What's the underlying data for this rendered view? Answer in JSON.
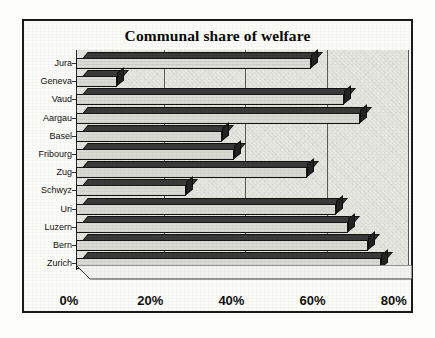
{
  "chart_data": {
    "type": "bar",
    "orientation": "horizontal",
    "title": "Communal share of welfare",
    "xlabel": "",
    "ylabel": "",
    "categories": [
      "Jura",
      "Geneva",
      "Vaud",
      "Aargau",
      "Basel",
      "Fribourg",
      "Zug",
      "Schwyz",
      "Uri",
      "Luzern",
      "Bern",
      "Zurich"
    ],
    "values": [
      58,
      10,
      66,
      70,
      36,
      39,
      57,
      27,
      64,
      67,
      72,
      75
    ],
    "xlim": [
      0,
      80
    ],
    "xticks": [
      0,
      20,
      40,
      60,
      80
    ],
    "xticklabels": [
      "0%",
      "20%",
      "40%",
      "60%",
      "80%"
    ],
    "grid": true,
    "legend": false,
    "style_3d": true,
    "colors": {
      "bar_face": "#dcdcd6",
      "bar_shadow": "#232323",
      "plot_background": "#e8e8e2",
      "frame": "#1a1a1a",
      "text": "#111111"
    }
  }
}
